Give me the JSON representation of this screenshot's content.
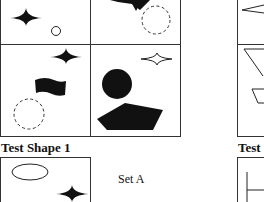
{
  "sets": {
    "set_a_label": "Set A"
  },
  "test_shapes": {
    "test_1_title": "Test Shape 1",
    "test_2_title": "Test Shape 2"
  },
  "grid_cells": [
    {
      "position": "top-left",
      "shapes": [
        "four-point-star-filled",
        "small-circle-outline"
      ]
    },
    {
      "position": "top-right",
      "shapes": [
        "black-triangle-down",
        "dashed-circle"
      ]
    },
    {
      "position": "bottom-left",
      "shapes": [
        "four-point-star-filled",
        "black-flag-wave",
        "dashed-circle"
      ]
    },
    {
      "position": "bottom-right",
      "shapes": [
        "four-point-star-outline",
        "black-circle",
        "black-pentagon"
      ]
    }
  ],
  "test_1_shapes": [
    "ellipse-outline",
    "four-point-star-filled"
  ],
  "colors": {
    "ink": "#111111",
    "line": "#333333",
    "background": "#ffffff"
  }
}
